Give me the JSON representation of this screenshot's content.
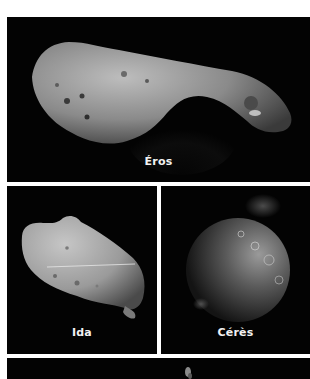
{
  "panels": [
    {
      "id": "eros",
      "label": "Éros",
      "subject": "elongated-asteroid"
    },
    {
      "id": "ida",
      "label": "Ida",
      "subject": "potato-shaped-asteroid"
    },
    {
      "id": "ceres",
      "label": "Cérès",
      "subject": "spherical-dwarf-planet"
    },
    {
      "id": "bottom",
      "label": "",
      "subject": "partially-visible-asteroid"
    }
  ],
  "colors": {
    "background": "#ffffff",
    "panel": "#030303",
    "label": "#f2f2f2"
  }
}
